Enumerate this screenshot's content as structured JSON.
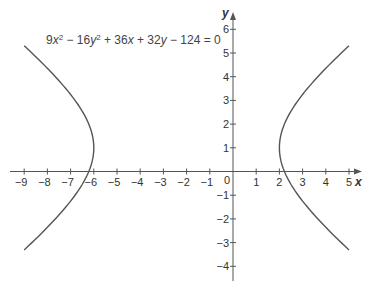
{
  "chart_data": {
    "type": "line",
    "title": "",
    "annotation": "9x² − 16y² + 36x + 32y − 124 = 0",
    "equation_parts": [
      {
        "t": "9",
        "i": false
      },
      {
        "t": "x",
        "i": true
      },
      {
        "t": "2",
        "sup": true
      },
      {
        "t": " − 16",
        "i": false
      },
      {
        "t": "y",
        "i": true
      },
      {
        "t": "2",
        "sup": true
      },
      {
        "t": " + 36",
        "i": false
      },
      {
        "t": "x",
        "i": true
      },
      {
        "t": " + 32",
        "i": false
      },
      {
        "t": "y",
        "i": true
      },
      {
        "t": " − 124 = 0",
        "i": false
      }
    ],
    "xlabel": "x",
    "ylabel": "y",
    "xlim": [
      -9,
      5
    ],
    "ylim": [
      -4,
      6
    ],
    "x_ticks": [
      -9,
      -8,
      -7,
      -6,
      -5,
      -4,
      -3,
      -2,
      -1,
      1,
      2,
      3,
      4,
      5
    ],
    "y_ticks": [
      -4,
      -3,
      -2,
      -1,
      1,
      2,
      3,
      4,
      5,
      6
    ],
    "origin_label": "0",
    "grid": false,
    "legend": null,
    "series": [
      {
        "name": "hyperbola left branch",
        "description": "(x+2)^2/16 - (y-1)^2/9 = 1, x <= -6",
        "center": [
          -2,
          1
        ],
        "vertex": [
          -6,
          1
        ],
        "x_range": [
          -9,
          -6
        ]
      },
      {
        "name": "hyperbola right branch",
        "description": "(x+2)^2/16 - (y-1)^2/9 = 1, x >= 2",
        "center": [
          -2,
          1
        ],
        "vertex": [
          2,
          1
        ],
        "x_range": [
          2,
          5
        ]
      }
    ],
    "hyperbola": {
      "h": -2,
      "k": 1,
      "a": 4,
      "b": 3,
      "orientation": "horizontal"
    }
  },
  "colors": {
    "axis": "#555555",
    "curve": "#555555",
    "text": "#333333"
  }
}
